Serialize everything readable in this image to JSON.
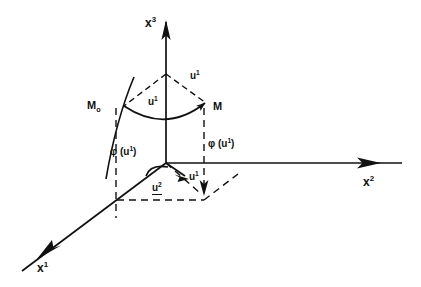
{
  "figure": {
    "background_color": "#ffffff",
    "ink_color": "#111111",
    "width": 421,
    "height": 287
  },
  "axes": [
    {
      "id": "x3",
      "base": "x",
      "exponent": "3",
      "description": "vertical axis pointing up",
      "label_x": 145,
      "label_y": 17
    },
    {
      "id": "x2",
      "base": "x",
      "exponent": "2",
      "description": "horizontal axis pointing right",
      "label_x": 363,
      "label_y": 176
    },
    {
      "id": "x1",
      "base": "x",
      "exponent": "1",
      "description": "oblique axis pointing down-left",
      "label_x": 37,
      "label_y": 262
    }
  ],
  "points": [
    {
      "id": "M0",
      "base": "M",
      "subscript": "o",
      "description": "initial point on cone base curve, left side",
      "label_x": 87,
      "label_y": 100
    },
    {
      "id": "M",
      "base": "M",
      "subscript": "",
      "description": "final point on cone base curve, right side",
      "label_x": 213,
      "label_y": 101
    }
  ],
  "annotations": [
    {
      "id": "u1-upper-right",
      "base": "u",
      "exponent": "1",
      "description": "generator line from apex to M",
      "label_x": 190,
      "label_y": 71
    },
    {
      "id": "u1-cone-interior",
      "base": "u",
      "exponent": "1",
      "description": "cone interior label",
      "label_x": 148,
      "label_y": 97
    },
    {
      "id": "u1-vertical-drop",
      "base": "u",
      "exponent": "1",
      "description": "vertical dashed drop line near origin",
      "label_x": 189,
      "label_y": 172
    },
    {
      "id": "u2-base",
      "base": "u",
      "exponent": "2",
      "description": "underlined base-plane label",
      "label_x": 152,
      "label_y": 183,
      "underlined": true
    },
    {
      "id": "phi-left",
      "text_prefix": "φ (u",
      "exponent": "1",
      "text_suffix": ")",
      "description": "angle function label left of x3 axis",
      "label_x": 110,
      "label_y": 147
    },
    {
      "id": "phi-right",
      "text_prefix": "φ (u",
      "exponent": "1",
      "text_suffix": ")",
      "description": "angle function label right of M drop line",
      "label_x": 208,
      "label_y": 139
    }
  ],
  "geometry": {
    "origin": {
      "x": 166,
      "y": 163
    },
    "apex": {
      "x": 166,
      "y": 74
    },
    "M0": {
      "x": 124,
      "y": 106
    },
    "M": {
      "x": 208,
      "y": 104
    }
  }
}
